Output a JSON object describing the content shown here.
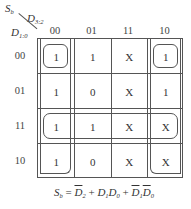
{
  "kmap": {
    "output_var": "S",
    "output_sub": "b",
    "col_var": "D",
    "col_sub": "3:2",
    "row_var": "D",
    "row_sub": "1:0",
    "col_headers": [
      "00",
      "01",
      "11",
      "10"
    ],
    "row_headers": [
      "00",
      "01",
      "11",
      "10"
    ],
    "cells": [
      [
        "1",
        "1",
        "X",
        "1"
      ],
      [
        "1",
        "0",
        "X",
        "1"
      ],
      [
        "1",
        "1",
        "X",
        "X"
      ],
      [
        "1",
        "0",
        "X",
        "X"
      ]
    ],
    "groups": [
      {
        "name": "D1D0-row11",
        "cells": "row 11, all columns"
      },
      {
        "name": "notD2-col00-col10",
        "cells": "columns 00 and 10 (wrap), all rows"
      },
      {
        "name": "notD1notD0-corners",
        "cells": "rows 00 and 10, columns 00 and 10"
      }
    ]
  },
  "formula": {
    "lhs": "S",
    "lhs_sub": "b",
    "eq": " = ",
    "t1": "D",
    "t1_sub": "2",
    "plus1": " + ",
    "t2a": "D",
    "t2a_sub": "1",
    "t2b": "D",
    "t2b_sub": "0",
    "plus2": " + ",
    "t3a": "D",
    "t3a_sub": "1",
    "t3b": "D",
    "t3b_sub": "0"
  }
}
